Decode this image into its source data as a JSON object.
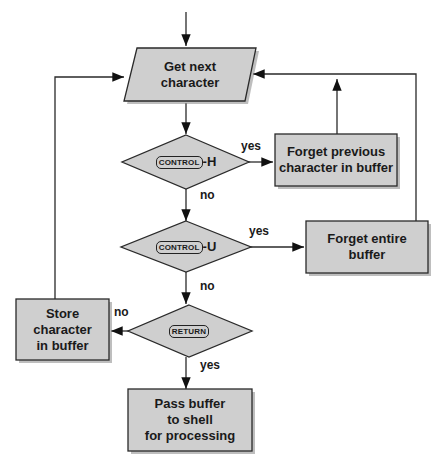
{
  "diagram": {
    "type": "flowchart",
    "colors": {
      "fill": "#cfcfcf",
      "stroke": "#2a2a2a",
      "shadow": "#8a8a8a",
      "background": "#ffffff"
    },
    "nodes": {
      "get_next": {
        "shape": "parallelogram",
        "line1": "Get next",
        "line2": "character"
      },
      "ctrl_h": {
        "shape": "diamond",
        "key": "CONTROL",
        "suffix": "-H"
      },
      "forget_prev": {
        "shape": "rect",
        "line1": "Forget previous",
        "line2": "character in buffer"
      },
      "ctrl_u": {
        "shape": "diamond",
        "key": "CONTROL",
        "suffix": "-U"
      },
      "forget_all": {
        "shape": "rect",
        "line1": "Forget entire",
        "line2": "buffer"
      },
      "return": {
        "shape": "diamond",
        "key": "RETURN",
        "suffix": ""
      },
      "store": {
        "shape": "rect",
        "line1": "Store",
        "line2": "character",
        "line3": "in buffer"
      },
      "pass": {
        "shape": "rect",
        "line1": "Pass buffer",
        "line2": "to shell",
        "line3": "for processing"
      }
    },
    "edges": {
      "ctrl_h_yes": "yes",
      "ctrl_h_no": "no",
      "ctrl_u_yes": "yes",
      "ctrl_u_no": "no",
      "return_no": "no",
      "return_yes": "yes"
    }
  }
}
